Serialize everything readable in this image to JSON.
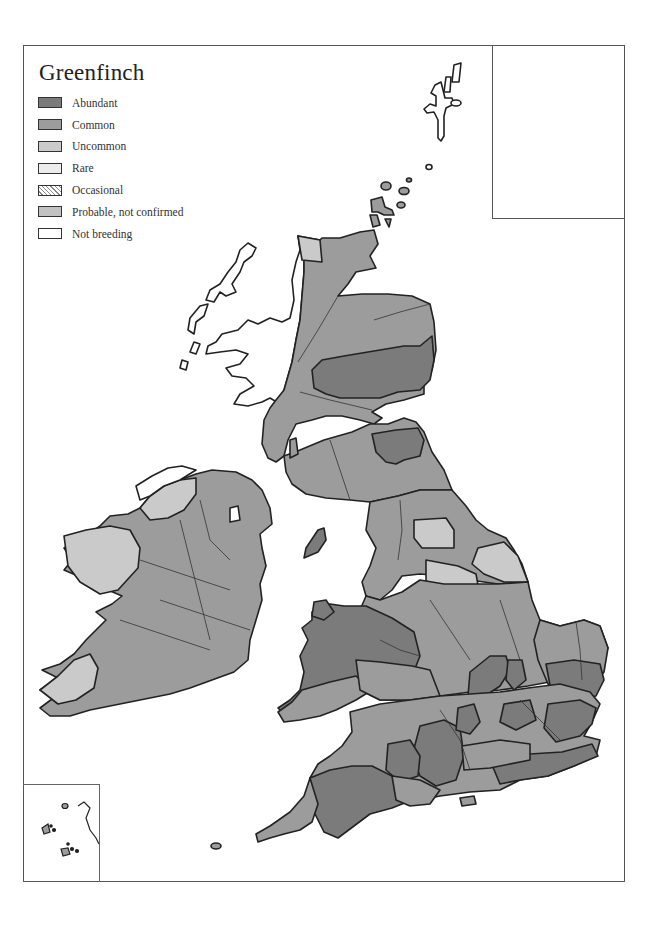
{
  "map": {
    "title": "Greenfinch",
    "legend": [
      {
        "label": "Abundant",
        "color": "#7b7b7b",
        "pattern": "solid"
      },
      {
        "label": "Common",
        "color": "#9c9c9c",
        "pattern": "solid"
      },
      {
        "label": "Uncommon",
        "color": "#cacaca",
        "pattern": "solid"
      },
      {
        "label": "Rare",
        "color": "#ededed",
        "pattern": "solid"
      },
      {
        "label": "Occasional",
        "color": "#ffffff",
        "pattern": "hatched"
      },
      {
        "label": "Probable, not confirmed",
        "color": "#c2c2c2",
        "pattern": "solid"
      },
      {
        "label": "Not breeding",
        "color": "#ffffff",
        "pattern": "solid"
      }
    ],
    "colors": {
      "abundant": "#7b7b7b",
      "common": "#9c9c9c",
      "uncommon": "#cacaca",
      "rare": "#ededed",
      "probable": "#c2c2c2",
      "not_breeding": "#ffffff",
      "outline": "#222222",
      "frame": "#555555"
    },
    "insets": {
      "top_right": "distribution-grid-overview",
      "bottom_left": "channel-islands-scilly"
    }
  }
}
